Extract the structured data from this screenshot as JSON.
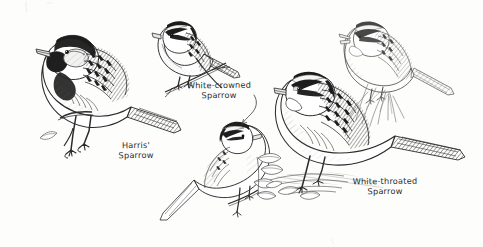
{
  "plate": {
    "title": "Sparrow identification plate",
    "medium": "pen-and-ink line drawing",
    "background_color": "#fdfdfc",
    "ink_color": "#2b2b2b",
    "width": 483,
    "height": 247
  },
  "labels": {
    "harris": {
      "line1": "Harris'",
      "line2": "Sparrow",
      "full": "Harris' Sparrow"
    },
    "white_crowned": {
      "line1": "White-crowned",
      "line2": "Sparrow",
      "full": "White-crowned Sparrow"
    },
    "white_throated": {
      "line1": "White-throated",
      "line2": "Sparrow",
      "full": "White-throated Sparrow"
    }
  },
  "figures": [
    {
      "id": "harris-sparrow",
      "name": "Harris' Sparrow",
      "position": "left",
      "pose": "perched on branch, facing left",
      "notes": "largest figure; black crown, face and bib, pale grey cheek patch, heavily streaked brown back, long tail angled down-right"
    },
    {
      "id": "white-crowned-sparrow-adult",
      "name": "White-crowned Sparrow (adult)",
      "position": "top center",
      "pose": "perched on thin twig, facing left",
      "notes": "bold black-and-white striped crown, plain grey breast, streaked wings"
    },
    {
      "id": "white-crowned-sparrow-immature",
      "name": "White-crowned Sparrow (immature)",
      "position": "center bottom",
      "pose": "perched on twig with leaf sprig, facing right",
      "notes": "lighter line work, dark crown stripes, long tail pointing down-left"
    },
    {
      "id": "white-throated-sparrow-ground",
      "name": "White-throated Sparrow",
      "position": "right",
      "pose": "standing on ground among leaves and grass, facing left",
      "notes": "striped crown, white throat patch, heavily hatched back and wings, long tail to the right"
    },
    {
      "id": "white-throated-sparrow-singing",
      "name": "White-throated Sparrow (singing)",
      "position": "top right",
      "pose": "perched in grass, bill open, facing left",
      "notes": "faint light-ink rendering, striped head, grass blades behind"
    }
  ],
  "leader_lines": [
    {
      "id": "leader-white-crowned",
      "from_label": "White-crowned Sparrow",
      "to_figure": "white-crowned-sparrow-immature",
      "style": "curved hand-drawn line with slight hook"
    }
  ]
}
